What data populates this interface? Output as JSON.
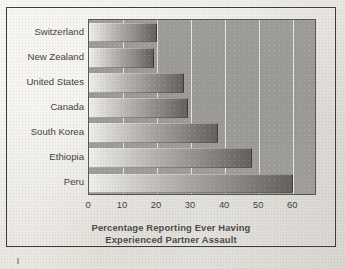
{
  "figure": {
    "frame_color": "#3c3b38",
    "paper_color": "#e9e7e2",
    "plot_background": "#9e9c98",
    "bar_light": "#efeeea",
    "bar_dark": "#63605c",
    "gridline_color": "#f3f2ef"
  },
  "chart_data": {
    "type": "bar",
    "orientation": "horizontal",
    "title": "",
    "xlabel_line1": "Percentage Reporting Ever Having",
    "xlabel_line2": "Experienced Partner Assault",
    "ylabel": "",
    "categories": [
      "Switzerland",
      "New Zealand",
      "United States",
      "Canada",
      "South Korea",
      "Ethiopia",
      "Peru"
    ],
    "values": [
      20,
      19,
      28,
      29,
      38,
      48,
      60
    ],
    "xticks": [
      0,
      10,
      20,
      30,
      40,
      50,
      60
    ],
    "xtick_labels": [
      "0",
      "10",
      "20",
      "30",
      "40",
      "50",
      "60"
    ],
    "xlim": [
      0,
      67
    ],
    "grid": "vertical",
    "legend": "none"
  }
}
